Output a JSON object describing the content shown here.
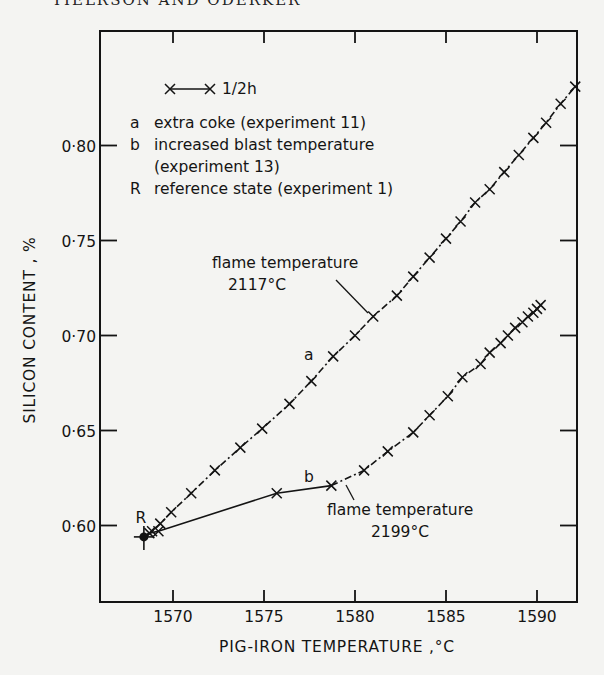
{
  "page": {
    "running_header": "TIELRSON AND ODERKER"
  },
  "chart_data": {
    "type": "line",
    "title": "",
    "xlabel": "PIG-IRON TEMPERATURE ,°C",
    "ylabel": "SILICON CONTENT , %",
    "xlim": [
      1566.0,
      1592.3
    ],
    "ylim": [
      0.56,
      0.86
    ],
    "x_ticks": [
      1570,
      1575,
      1580,
      1585,
      1590
    ],
    "x_tick_labels": [
      "1570",
      "1575",
      "1580",
      "1585",
      "1590"
    ],
    "y_ticks": [
      0.6,
      0.65,
      0.7,
      0.75,
      0.8
    ],
    "y_tick_labels": [
      "0·60",
      "0·65",
      "0·70",
      "0·75",
      "0·80"
    ],
    "grid": false,
    "legend_position": "upper left (inside plot)",
    "legend": {
      "time_scale": {
        "label": "1/2h",
        "description": "marker interval = ½ hour"
      },
      "entries": [
        {
          "key": "a",
          "text": "extra coke (experiment 11)"
        },
        {
          "key": "b",
          "text": "increased blast temperature",
          "text2": "(experiment 13)"
        },
        {
          "key": "R",
          "text": "reference state (experiment 1)"
        }
      ]
    },
    "annotations": [
      {
        "text": "flame temperature",
        "text2": "2117°C",
        "series": "a",
        "x": 1581.0,
        "y": 0.71
      },
      {
        "text": "flame temperature",
        "text2": "2199°C",
        "series": "b",
        "x": 1580.0,
        "y": 0.624
      },
      {
        "text": "a",
        "series": "a"
      },
      {
        "text": "b",
        "series": "b"
      },
      {
        "text": "R",
        "x": 1568.4,
        "y": 0.594
      }
    ],
    "reference_point": {
      "label": "R",
      "x": 1568.4,
      "y": 0.594
    },
    "series": [
      {
        "name": "a",
        "description": "extra coke (experiment 11)",
        "line_style": "dash-dot with x markers",
        "points": [
          [
            1568.4,
            0.594
          ],
          [
            1568.85,
            0.597
          ],
          [
            1569.3,
            0.601
          ],
          [
            1569.9,
            0.607
          ],
          [
            1571.0,
            0.617
          ],
          [
            1572.3,
            0.629
          ],
          [
            1573.7,
            0.641
          ],
          [
            1574.9,
            0.651
          ],
          [
            1576.4,
            0.664
          ],
          [
            1577.6,
            0.676
          ],
          [
            1578.8,
            0.689
          ],
          [
            1580.0,
            0.7
          ],
          [
            1581.0,
            0.71
          ],
          [
            1582.3,
            0.721
          ],
          [
            1583.2,
            0.731
          ],
          [
            1584.1,
            0.741
          ],
          [
            1585.0,
            0.751
          ],
          [
            1585.8,
            0.76
          ],
          [
            1586.6,
            0.77
          ],
          [
            1587.4,
            0.777
          ],
          [
            1588.2,
            0.786
          ],
          [
            1589.0,
            0.795
          ],
          [
            1589.8,
            0.804
          ],
          [
            1590.5,
            0.812
          ],
          [
            1591.3,
            0.822
          ],
          [
            1592.1,
            0.831
          ]
        ]
      },
      {
        "name": "b",
        "description": "increased blast temperature (experiment 13)",
        "line_style": "solid until flame temperature reached, then dash-dot with x markers",
        "points": [
          [
            1568.4,
            0.594
          ],
          [
            1568.7,
            0.596
          ],
          [
            1569.2,
            0.597
          ],
          [
            1575.7,
            0.617
          ],
          [
            1578.7,
            0.621
          ],
          [
            1580.5,
            0.629
          ],
          [
            1581.8,
            0.639
          ],
          [
            1583.2,
            0.649
          ],
          [
            1584.1,
            0.658
          ],
          [
            1585.1,
            0.668
          ],
          [
            1585.9,
            0.678
          ],
          [
            1586.9,
            0.685
          ],
          [
            1587.4,
            0.691
          ],
          [
            1588.0,
            0.696
          ],
          [
            1588.4,
            0.7
          ],
          [
            1588.8,
            0.704
          ],
          [
            1589.2,
            0.707
          ],
          [
            1589.5,
            0.71
          ],
          [
            1589.8,
            0.712
          ],
          [
            1590.0,
            0.714
          ],
          [
            1590.2,
            0.716
          ]
        ],
        "solid_until_index": 4
      }
    ]
  }
}
